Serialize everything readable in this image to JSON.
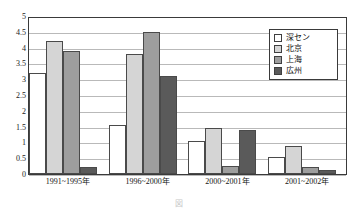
{
  "chart_data": {
    "type": "bar",
    "title": "",
    "xlabel": "",
    "ylabel": "",
    "ylim": [
      0,
      5
    ],
    "ytick_step": 0.5,
    "yticks": [
      "5",
      "4.5",
      "4",
      "3.5",
      "3",
      "2.5",
      "2",
      "1.5",
      "1",
      "0.5",
      "0"
    ],
    "grid": true,
    "legend_position": "top-right",
    "categories": [
      "1991~1995年",
      "1996~2000年",
      "2000~2001年",
      "2001~2002年"
    ],
    "series": [
      {
        "name": "深セン",
        "color": "#ffffff",
        "values": [
          3.2,
          1.55,
          1.05,
          0.55
        ]
      },
      {
        "name": "北京",
        "color": "#d5d5d5",
        "values": [
          4.2,
          3.8,
          1.47,
          0.88
        ]
      },
      {
        "name": "上海",
        "color": "#9e9e9e",
        "values": [
          3.9,
          4.5,
          0.25,
          0.23
        ]
      },
      {
        "name": "広州",
        "color": "#5a5a5a",
        "values": [
          0.22,
          3.1,
          1.4,
          0.12
        ]
      }
    ]
  },
  "legend": {
    "items": [
      {
        "label": "深セン"
      },
      {
        "label": "北京"
      },
      {
        "label": "上海"
      },
      {
        "label": "広州"
      }
    ]
  },
  "caption": {
    "text": "図"
  }
}
